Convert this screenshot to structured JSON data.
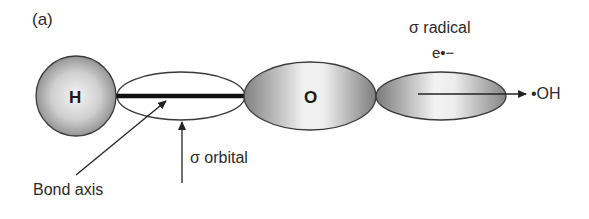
{
  "panel_label": "(a)",
  "atoms": {
    "hydrogen": "H",
    "oxygen": "O"
  },
  "labels": {
    "sigma_radical": "σ radical",
    "electron": "e•−",
    "hydroxyl_radical": "•OH",
    "sigma_orbital": "σ orbital",
    "bond_axis": "Bond axis"
  },
  "colors": {
    "stroke": "#333333",
    "shade_dark": "#7a7a7a",
    "shade_light": "#f2f2f2"
  }
}
